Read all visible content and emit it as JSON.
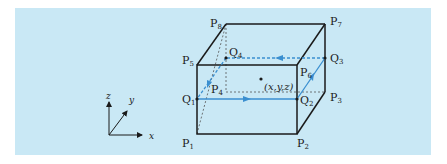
{
  "diagram": {
    "background_color": "#c9e8f5",
    "edge_color": "#1a1a1a",
    "path_color": "#3a8fd0",
    "vertices": [
      {
        "name": "P",
        "sub": "1"
      },
      {
        "name": "P",
        "sub": "2"
      },
      {
        "name": "P",
        "sub": "3"
      },
      {
        "name": "P",
        "sub": "4"
      },
      {
        "name": "P",
        "sub": "5"
      },
      {
        "name": "P",
        "sub": "6"
      },
      {
        "name": "P",
        "sub": "7"
      },
      {
        "name": "P",
        "sub": "8"
      }
    ],
    "path_points": [
      {
        "name": "Q",
        "sub": "1"
      },
      {
        "name": "Q",
        "sub": "2"
      },
      {
        "name": "Q",
        "sub": "3"
      },
      {
        "name": "Q",
        "sub": "4"
      }
    ],
    "center_point_label": "(x,y,z)",
    "axes": {
      "x": "x",
      "y": "y",
      "z": "z"
    }
  }
}
